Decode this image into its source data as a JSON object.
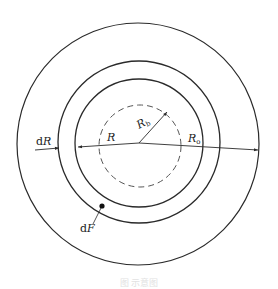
{
  "figure": {
    "stroke_color": "#2a2a2a",
    "dashed_color": "#555555",
    "circles": [
      {
        "name": "outer-circle",
        "cx": 138,
        "cy": 144,
        "r": 121,
        "style": "solid"
      },
      {
        "name": "middle-ring-circle",
        "cx": 139,
        "cy": 142,
        "r": 81,
        "style": "solid"
      },
      {
        "name": "inner-ring-circle",
        "cx": 139,
        "cy": 143,
        "r": 64,
        "style": "solid"
      },
      {
        "name": "dashed-circle",
        "cx": 140,
        "cy": 146,
        "r": 41,
        "style": "dashed"
      }
    ],
    "labels": {
      "dR": {
        "d": "d",
        "var": "R"
      },
      "R": {
        "var": "R"
      },
      "Rb": {
        "var": "R",
        "sub": "b"
      },
      "Ro": {
        "var": "R",
        "sub": "o"
      },
      "dF": {
        "d": "d",
        "var": "F"
      }
    },
    "caption": "图    示意图"
  }
}
